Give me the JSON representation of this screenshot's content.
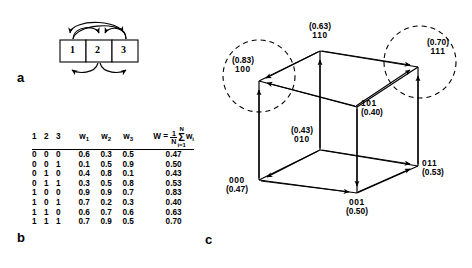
{
  "figure": {
    "panel_a": {
      "letter": "a",
      "units": [
        "1",
        "2",
        "3"
      ],
      "connections": [
        {
          "from": "1",
          "to": "2",
          "style": "upper-arc"
        },
        {
          "from": "1",
          "to": "3",
          "style": "upper-arc-long"
        },
        {
          "from": "3",
          "to": "2",
          "style": "upper-arc"
        },
        {
          "from": "3",
          "to": "1",
          "style": "upper-arc-long"
        },
        {
          "from": "2",
          "to": "1",
          "style": "lower-arc"
        },
        {
          "from": "2",
          "to": "3",
          "style": "lower-arc"
        }
      ]
    },
    "panel_b": {
      "letter": "b",
      "headers": {
        "bits": "1 2 3",
        "w1": "w",
        "w1sub": "1",
        "w2": "w",
        "w2sub": "2",
        "w3": "w",
        "w3sub": "3",
        "W": "W",
        "W_equals": "=",
        "W_frac_num": "1",
        "W_frac_den": "N",
        "W_sigma_top": "N",
        "W_sigma_sym": "Σ",
        "W_sigma_bot": "i=1",
        "W_term": "w",
        "W_term_sub": "i"
      },
      "rows": [
        {
          "bits": "0 0 0",
          "w1": "0.6",
          "w2": "0.3",
          "w3": "0.5",
          "W": "0.47"
        },
        {
          "bits": "0 0 1",
          "w1": "0.1",
          "w2": "0.5",
          "w3": "0.9",
          "W": "0.50"
        },
        {
          "bits": "0 1 0",
          "w1": "0.4",
          "w2": "0.8",
          "w3": "0.1",
          "W": "0.43"
        },
        {
          "bits": "0 1 1",
          "w1": "0.3",
          "w2": "0.5",
          "w3": "0.8",
          "W": "0.53"
        },
        {
          "bits": "1 0 0",
          "w1": "0.9",
          "w2": "0.9",
          "w3": "0.7",
          "W": "0.83"
        },
        {
          "bits": "1 0 1",
          "w1": "0.7",
          "w2": "0.2",
          "w3": "0.3",
          "W": "0.40"
        },
        {
          "bits": "1 1 0",
          "w1": "0.6",
          "w2": "0.7",
          "w3": "0.6",
          "W": "0.63"
        },
        {
          "bits": "1 1 1",
          "w1": "0.7",
          "w2": "0.9",
          "w3": "0.5",
          "W": "0.70"
        }
      ]
    },
    "panel_c": {
      "letter": "c",
      "vertices": [
        {
          "code": "110",
          "value": "(0.63)",
          "order": "value-above"
        },
        {
          "code": "100",
          "value": "(0.83)",
          "order": "value-above",
          "attractor": true
        },
        {
          "code": "111",
          "value": "(0.70)",
          "order": "value-above",
          "attractor": true
        },
        {
          "code": "101",
          "value": "(0.40)",
          "order": "code-above"
        },
        {
          "code": "010",
          "value": "(0.43)",
          "order": "value-above"
        },
        {
          "code": "000",
          "value": "(0.47)",
          "order": "code-above"
        },
        {
          "code": "001",
          "value": "(0.50)",
          "order": "code-above"
        },
        {
          "code": "011",
          "value": "(0.53)",
          "order": "code-above"
        }
      ],
      "attractor_circles": 2,
      "colors": {
        "line": "#000000",
        "background": "#ffffff"
      }
    }
  }
}
